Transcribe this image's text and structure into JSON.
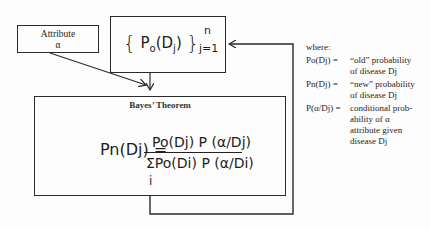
{
  "diagram": {
    "attribute_box": {
      "label": "Attribute",
      "symbol": "α"
    },
    "prior_box": {
      "open_brace": "{",
      "expr_P": "P",
      "expr_P_sub": "o",
      "expr_arg": "(D",
      "expr_arg_sub": "j",
      "expr_close": ")",
      "close_brace": "}",
      "upper_limit": "n",
      "lower_limit": "j=1"
    },
    "bayes_box": {
      "title": "Bayes’ Theorem",
      "lhs": "Pn(Dj) =",
      "numerator": "Po(Dj) P (α/Dj)",
      "denominator": "ΣPo(Di) P (α/Di)",
      "sum_index": "i"
    },
    "edges": [
      {
        "from": "attribute_box",
        "to": "bayes_box",
        "type": "arrow"
      },
      {
        "from": "prior_box",
        "to": "bayes_box",
        "type": "arrow"
      },
      {
        "from": "bayes_box",
        "to": "prior_box",
        "type": "feedback-arrow"
      }
    ]
  },
  "legend": {
    "heading": "where:",
    "items": [
      {
        "term": "Po(Dj) =",
        "definition": "“old” probability\nof disease Dj"
      },
      {
        "term": "Pn(Dj) =",
        "definition": "“new” probability\nof disease Dj"
      },
      {
        "term": "P(α/Dj) =",
        "definition": "conditional prob-\nability of α\nattribute given\ndisease Dj"
      }
    ]
  }
}
